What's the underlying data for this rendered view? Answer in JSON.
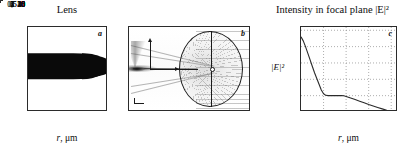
{
  "figure": {
    "panels": [
      {
        "id": "a",
        "letter": "a",
        "title": "Lens",
        "xlabel_var": "r",
        "xlabel_unit": ", μm"
      },
      {
        "id": "b",
        "letter": "b",
        "title": "",
        "axis_v_label": "z",
        "axis_h_label": "r"
      },
      {
        "id": "c",
        "letter": "c",
        "title": "Intensity in focal plane |E|²",
        "ylabel": "|E|²",
        "xlabel_var": "r",
        "xlabel_unit": ", μm"
      }
    ]
  },
  "chart_data": [
    {
      "type": "area",
      "id": "panel-a",
      "title": "Lens",
      "xlabel": "r, μm",
      "ylabel": "",
      "xlim": [
        0,
        7.6
      ],
      "ylim": [
        40,
        0
      ],
      "xticks": [
        1,
        2,
        3,
        4,
        5,
        6,
        7
      ],
      "xtick_labels": [
        "1",
        "2",
        "3",
        "4",
        "5",
        "6",
        "7"
      ],
      "yticks": [
        0,
        5,
        10,
        15,
        20,
        25,
        30,
        35,
        40
      ],
      "ytick_labels": [
        "0",
        "5",
        "10",
        "15",
        "20",
        "25",
        "30",
        "35",
        "40"
      ],
      "grid": false,
      "description": "Black lens cross-section profile, a blunt tapering wedge spanning z from about 24 to 36 microns at r=0 and narrowing to a rounded point near r=7 microns",
      "series": [
        {
          "name": "lens upper boundary",
          "x": [
            0,
            1,
            2,
            3,
            4,
            5,
            6,
            6.6,
            7.0
          ],
          "values": [
            24.2,
            24.4,
            24.8,
            25.4,
            26.2,
            27.2,
            28.4,
            29.3,
            30.0
          ]
        },
        {
          "name": "lens lower boundary",
          "x": [
            0,
            1,
            2,
            3,
            4,
            5,
            6,
            6.6,
            7.0
          ],
          "values": [
            35.6,
            35.5,
            35.2,
            34.6,
            33.8,
            32.8,
            31.6,
            30.8,
            30.0
          ]
        }
      ]
    },
    {
      "type": "heatmap",
      "id": "panel-b",
      "title": "",
      "description": "Ray-tracing field map: an oval lens outline at right with vertical and horizontal axis lines through its centre, a dense ray bundle converging to a bright focal spot at the left edge, and faint parallel rays entering from the right",
      "grid": false
    },
    {
      "type": "line",
      "id": "panel-c",
      "title": "Intensity in focal plane |E|²",
      "xlabel": "r, μm",
      "ylabel": "|E|²",
      "xlim": [
        0,
        2.15
      ],
      "ylim": [
        0,
        52
      ],
      "xticks": [
        0.5,
        1,
        1.5,
        2
      ],
      "xtick_labels": [
        "0,5",
        "1",
        "1,5",
        "2"
      ],
      "yticks": [
        0,
        10,
        20,
        30,
        40,
        50
      ],
      "ytick_labels": [
        "0",
        "10",
        "20",
        "30",
        "40",
        "50"
      ],
      "grid": true,
      "grid_style": "dotted",
      "legend": null,
      "series": [
        {
          "name": "|E|^2",
          "x": [
            0.0,
            0.05,
            0.1,
            0.15,
            0.2,
            0.25,
            0.3,
            0.35,
            0.4,
            0.45,
            0.5,
            0.55,
            0.6,
            0.65,
            0.7,
            0.8,
            0.9,
            0.95,
            1.0,
            1.1,
            1.2,
            1.3,
            1.4,
            1.5,
            1.6,
            1.7,
            1.8,
            1.9,
            2.0
          ],
          "values": [
            46.0,
            43.5,
            40.0,
            36.0,
            32.0,
            28.0,
            24.0,
            20.5,
            17.0,
            13.5,
            11.2,
            10.2,
            10.0,
            10.0,
            10.0,
            10.0,
            10.0,
            9.9,
            9.5,
            8.6,
            7.6,
            6.6,
            5.6,
            4.6,
            3.7,
            2.8,
            1.9,
            1.0,
            0.3
          ]
        }
      ]
    }
  ]
}
